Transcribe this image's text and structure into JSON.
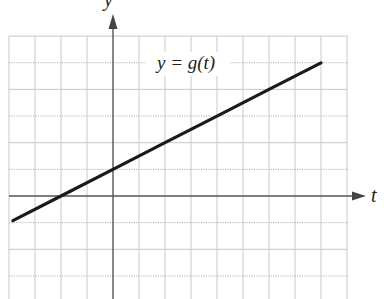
{
  "chart_data": {
    "type": "line",
    "title": "",
    "xlabel": "t",
    "ylabel": "y",
    "xlim": [
      -4,
      9
    ],
    "ylim": [
      -3.9,
      6
    ],
    "grid": true,
    "grid_spacing": 1,
    "tick_labels_shown": false,
    "series": [
      {
        "name": "y = g(t)",
        "label": "y = g(t)",
        "equation": "g(t) = 1 + t/2",
        "slope": 0.5,
        "intercept": 1,
        "x": [
          -3.85,
          -2,
          0,
          2,
          4,
          6,
          8
        ],
        "values": [
          -0.925,
          0,
          1,
          2,
          3,
          4,
          5
        ],
        "color": "#1a1a1a"
      }
    ],
    "annotations": [
      {
        "text": "y = g(t)",
        "x": 3.5,
        "y": 5
      }
    ]
  },
  "labels": {
    "x_axis": "t",
    "y_axis": "y",
    "curve": "y = g(t)"
  },
  "colors": {
    "grid": "#c8c8c8",
    "axis": "#555555",
    "line": "#1a1a1a",
    "background": "#ffffff"
  }
}
